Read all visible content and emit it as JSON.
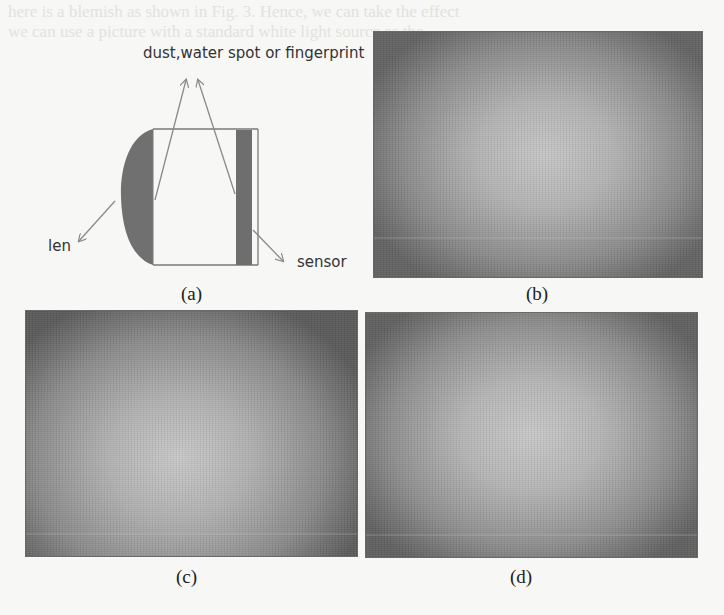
{
  "figure": {
    "bleed_through_text": [
      "here is a blemish as shown in Fig. 3. Hence, we can take the effect",
      "we can use a picture with a standard white light source as the",
      "s             objectives."
    ],
    "panels": [
      {
        "id": "a",
        "caption": "(a)",
        "type": "diagram",
        "labels": {
          "top": "dust,water spot or fingerprint",
          "left": "len",
          "right": "sensor"
        }
      },
      {
        "id": "b",
        "caption": "(b)",
        "type": "photo",
        "description": "gray vignetted white-field image, bright center, dark corners"
      },
      {
        "id": "c",
        "caption": "(c)",
        "type": "photo",
        "description": "gray vignetted white-field image, bright region left of center, dark right edge"
      },
      {
        "id": "d",
        "caption": "(d)",
        "type": "photo",
        "description": "gray vignetted white-field image, bright center, dark corners"
      }
    ],
    "colors": {
      "lens_fill": "#707070",
      "sensor_fill": "#6e6e6e",
      "arrow_stroke": "#8a8a8a",
      "photo_center": "#c4c4c4",
      "photo_edge": "#5a5a5a"
    }
  }
}
